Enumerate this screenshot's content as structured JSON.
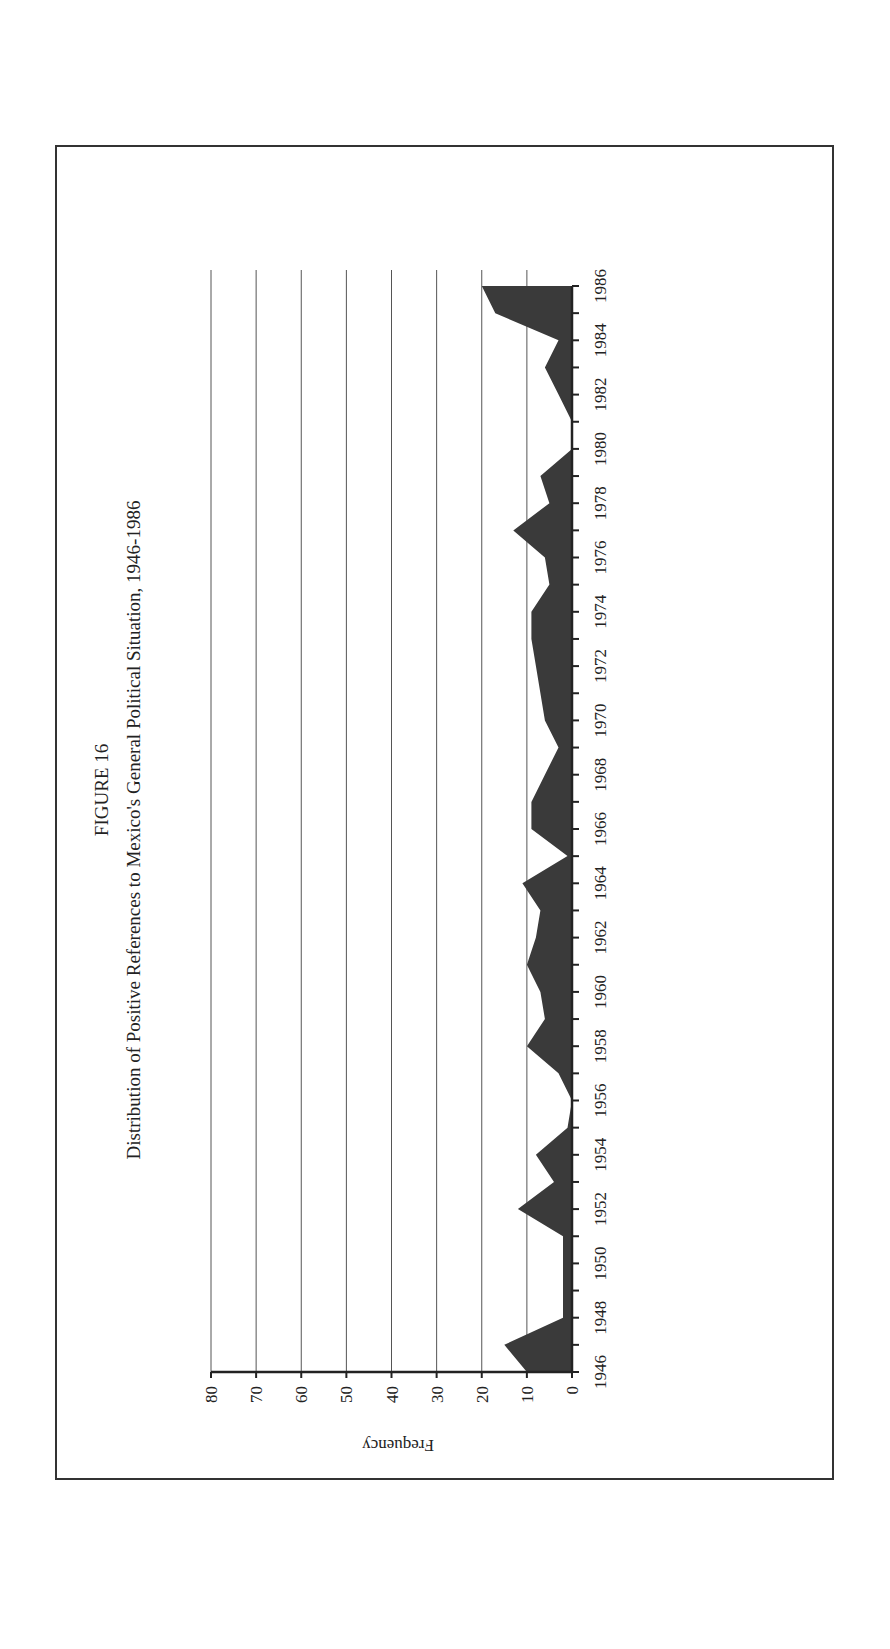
{
  "figure": {
    "number": "FIGURE 16",
    "title": "Distribution of Positive References to Mexico's General Political Situation, 1946-1986"
  },
  "colors": {
    "area_fill": "#3a3a3a",
    "frame": "#333333",
    "grid": "#555555"
  },
  "chart_data": {
    "type": "area",
    "xlabel": "",
    "ylabel": "Frequency",
    "ylim": [
      0,
      80
    ],
    "yticks": [
      0,
      10,
      20,
      30,
      40,
      50,
      60,
      70,
      80
    ],
    "grid": true,
    "orientation": "page rotated 90 degrees; years run bottom-to-top along right edge",
    "x_tick_labels": [
      "1946",
      "1948",
      "1950",
      "1952",
      "1954",
      "1956",
      "1958",
      "1960",
      "1962",
      "1964",
      "1966",
      "1968",
      "1970",
      "1972",
      "1974",
      "1976",
      "1978",
      "1980",
      "1982",
      "1984",
      "1986"
    ],
    "x": [
      1946,
      1947,
      1948,
      1949,
      1950,
      1951,
      1952,
      1953,
      1954,
      1955,
      1956,
      1957,
      1958,
      1959,
      1960,
      1961,
      1962,
      1963,
      1964,
      1965,
      1966,
      1967,
      1968,
      1969,
      1970,
      1971,
      1972,
      1973,
      1974,
      1975,
      1976,
      1977,
      1978,
      1979,
      1980,
      1981,
      1982,
      1983,
      1984,
      1985,
      1986
    ],
    "series": [
      {
        "name": "Positive references",
        "values": [
          10,
          15,
          2,
          2,
          2,
          2,
          12,
          4,
          8,
          1,
          0,
          3,
          10,
          6,
          7,
          10,
          8,
          7,
          11,
          1,
          9,
          9,
          6,
          3,
          6,
          7,
          8,
          9,
          9,
          5,
          6,
          13,
          5,
          7,
          0,
          0,
          3,
          6,
          3,
          17,
          20
        ]
      }
    ],
    "legend": null
  }
}
